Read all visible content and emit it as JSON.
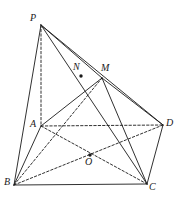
{
  "figure": {
    "type": "solid-geometry-diagram",
    "stroke_color": "#1a1a1a",
    "background_color": "#ffffff",
    "canvas": {
      "width": 179,
      "height": 205
    }
  },
  "vertices": [
    {
      "id": "P",
      "label": "P",
      "x": 41,
      "y": 25,
      "label_x": 30,
      "label_y": 13,
      "dot": false
    },
    {
      "id": "A",
      "label": "A",
      "x": 41,
      "y": 126,
      "label_x": 30,
      "label_y": 119,
      "dot": false
    },
    {
      "id": "B",
      "label": "B",
      "x": 14,
      "y": 185,
      "label_x": 4,
      "label_y": 177,
      "dot": false
    },
    {
      "id": "C",
      "label": "C",
      "x": 147,
      "y": 184,
      "label_x": 149,
      "label_y": 182,
      "dot": false
    },
    {
      "id": "D",
      "label": "D",
      "x": 163,
      "y": 125,
      "label_x": 166,
      "label_y": 118,
      "dot": false
    },
    {
      "id": "M",
      "label": "M",
      "x": 102,
      "y": 78,
      "label_x": 101,
      "label_y": 63,
      "dot": false
    },
    {
      "id": "N",
      "label": "N",
      "x": 81,
      "y": 76,
      "label_x": 73,
      "label_y": 62,
      "dot": true
    },
    {
      "id": "O",
      "label": "O",
      "x": 90,
      "y": 155,
      "label_x": 85,
      "label_y": 157,
      "dot": true
    }
  ],
  "edges_solid": [
    {
      "name": "edge-P-B",
      "from": "P",
      "to": "B"
    },
    {
      "name": "edge-P-M",
      "from": "P",
      "to": "M"
    },
    {
      "name": "edge-P-D",
      "from": "P",
      "to": "D"
    },
    {
      "name": "edge-P-C",
      "from": "P",
      "to": "C"
    },
    {
      "name": "edge-B-C",
      "from": "B",
      "to": "C"
    },
    {
      "name": "edge-C-D",
      "from": "C",
      "to": "D"
    },
    {
      "name": "edge-M-C",
      "from": "M",
      "to": "C"
    },
    {
      "name": "edge-M-D",
      "from": "M",
      "to": "D"
    },
    {
      "name": "edge-A-M",
      "from": "A",
      "to": "M"
    },
    {
      "name": "edge-A-B",
      "from": "A",
      "to": "B"
    }
  ],
  "edges_dashed": [
    {
      "name": "edge-P-A",
      "from": "P",
      "to": "A"
    },
    {
      "name": "edge-A-D",
      "from": "A",
      "to": "D"
    },
    {
      "name": "edge-A-C",
      "from": "A",
      "to": "C"
    },
    {
      "name": "edge-B-M",
      "from": "B",
      "to": "M"
    },
    {
      "name": "edge-B-D",
      "from": "B",
      "to": "D"
    }
  ]
}
